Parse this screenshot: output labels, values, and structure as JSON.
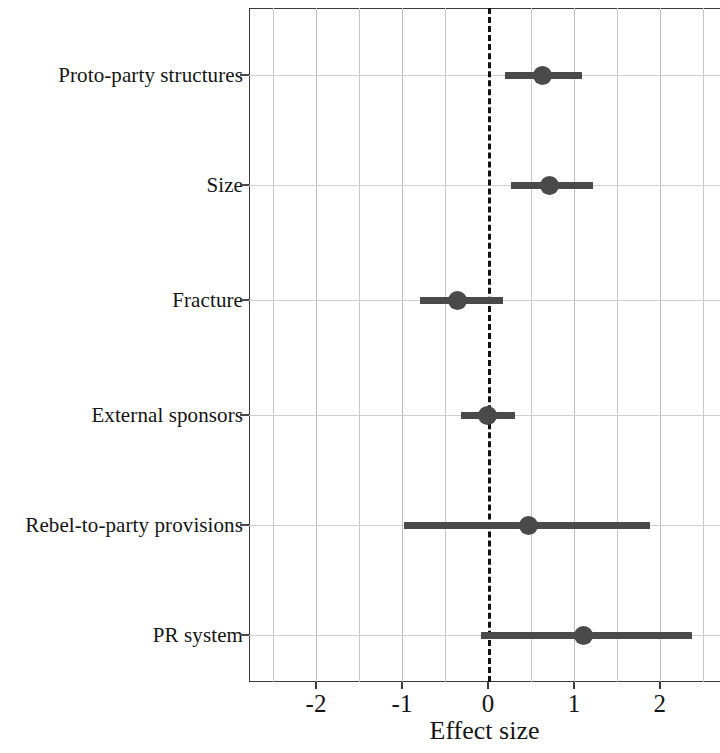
{
  "chart_data": {
    "type": "scatter",
    "subtype": "forest-plot",
    "title": "",
    "xlabel": "Effect size",
    "ylabel": "",
    "xlim": [
      -2.78,
      2.7
    ],
    "xticks": [
      -2,
      -1,
      0,
      1,
      2
    ],
    "xticklabels": [
      "-2",
      "-1",
      "0",
      "1",
      "2"
    ],
    "minor_xtick_step": 0.5,
    "grid": true,
    "grid_axis": "both",
    "legend": "none",
    "reference_line": {
      "value": 0,
      "style": "dashed",
      "color": "#111111"
    },
    "categories": [
      "Proto-party structures",
      "Size",
      "Fracture",
      "External sponsors",
      "Rebel-to-party provisions",
      "PR system"
    ],
    "point_color": "#4a4a4a",
    "series": [
      {
        "name": "Effect size estimate",
        "estimates": [
          0.64,
          0.72,
          -0.35,
          0.0,
          0.47,
          1.11
        ],
        "ci_low": [
          0.2,
          0.27,
          -0.79,
          -0.31,
          -0.98,
          -0.08
        ],
        "ci_high": [
          1.1,
          1.22,
          0.17,
          0.31,
          1.88,
          2.38
        ]
      }
    ],
    "points": [
      {
        "label": "Proto-party structures",
        "estimate": 0.64,
        "ci_low": 0.2,
        "ci_high": 1.1
      },
      {
        "label": "Size",
        "estimate": 0.72,
        "ci_low": 0.27,
        "ci_high": 1.22
      },
      {
        "label": "Fracture",
        "estimate": -0.35,
        "ci_low": -0.79,
        "ci_high": 0.17
      },
      {
        "label": "External sponsors",
        "estimate": 0.0,
        "ci_low": -0.31,
        "ci_high": 0.31
      },
      {
        "label": "Rebel-to-party provisions",
        "estimate": 0.47,
        "ci_low": -0.98,
        "ci_high": 1.88
      },
      {
        "label": "PR system",
        "estimate": 1.11,
        "ci_low": -0.08,
        "ci_high": 2.38
      }
    ]
  },
  "axis": {
    "x_title": "Effect size"
  }
}
